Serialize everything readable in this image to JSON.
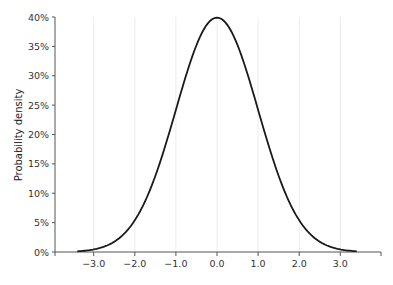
{
  "chart_data": {
    "type": "line",
    "title": "",
    "xlabel": "",
    "ylabel": "Probability density",
    "xlim": [
      -3.95,
      4.0
    ],
    "ylim": [
      0,
      0.4
    ],
    "grid": {
      "x": true,
      "y": false
    },
    "legend": null,
    "x_ticks": [
      -3.0,
      -2.0,
      -1.0,
      0.0,
      1.0,
      2.0,
      3.0
    ],
    "x_tick_labels": [
      "−3.0",
      "−2.0",
      "−1.0",
      "0.0",
      "1.0",
      "2.0",
      "3.0"
    ],
    "y_ticks": [
      0,
      0.05,
      0.1,
      0.15,
      0.2,
      0.25,
      0.3,
      0.35,
      0.4
    ],
    "y_tick_labels": [
      "0%",
      "5%",
      "10%",
      "15%",
      "20%",
      "25%",
      "30%",
      "35%",
      "40%"
    ],
    "series": [
      {
        "name": "Standard normal density",
        "color": "#1a1a1a",
        "distribution": {
          "mean": 0,
          "sd": 1
        },
        "x": [
          -3.4,
          -3.0,
          -2.5,
          -2.0,
          -1.5,
          -1.0,
          -0.5,
          0.0,
          0.5,
          1.0,
          1.5,
          2.0,
          2.5,
          3.0,
          3.4
        ],
        "y": [
          0.001,
          0.004,
          0.018,
          0.054,
          0.13,
          0.242,
          0.352,
          0.399,
          0.352,
          0.242,
          0.13,
          0.054,
          0.018,
          0.004,
          0.001
        ]
      }
    ]
  },
  "colors": {
    "axis": "#555555",
    "grid": "#ececec",
    "curve": "#1a1a1a"
  }
}
